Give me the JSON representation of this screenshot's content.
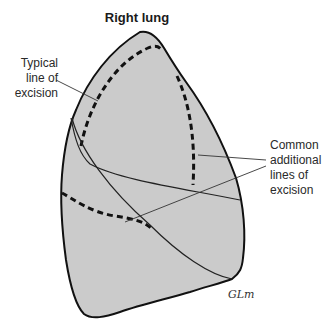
{
  "figure": {
    "title": "Right lung",
    "labels": {
      "typical": [
        "Typical",
        "line of",
        "excision"
      ],
      "common": [
        "Common",
        "additional",
        "lines of",
        "excision"
      ]
    },
    "signature": "GLm",
    "caption": "Figure"
  },
  "colors": {
    "lung_fill": "#cbcbcb",
    "outline": "#111111",
    "leader": "#333333"
  }
}
